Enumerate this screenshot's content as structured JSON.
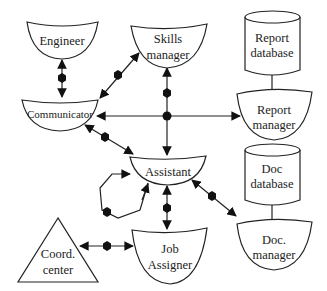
{
  "diagram": {
    "nodes": {
      "engineer": {
        "label": "Engineer",
        "shape": "bowl"
      },
      "skills_manager": {
        "label_line1": "Skills",
        "label_line2": "manager",
        "shape": "bowl"
      },
      "report_database": {
        "label_line1": "Report",
        "label_line2": "database",
        "shape": "cylinder"
      },
      "report_manager": {
        "label_line1": "Report",
        "label_line2": "manager",
        "shape": "bowl"
      },
      "communicator": {
        "label": "Communicator",
        "shape": "bowl"
      },
      "assistant": {
        "label": "Assistant",
        "shape": "bowl"
      },
      "doc_database": {
        "label_line1": "Doc",
        "label_line2": "database",
        "shape": "cylinder"
      },
      "doc_manager": {
        "label_line1": "Doc.",
        "label_line2": "manager",
        "shape": "bowl"
      },
      "coord_center": {
        "label_line1": "Coord.",
        "label_line2": "center",
        "shape": "triangle"
      },
      "job_assigner": {
        "label_line1": "Job",
        "label_line2": "Assigner",
        "shape": "bowl"
      }
    },
    "edges": [
      {
        "from": "Engineer",
        "to": "Communicator",
        "type": "bidirectional-with-hexagon"
      },
      {
        "from": "Skills manager",
        "to": "Communicator",
        "type": "bidirectional-with-hexagon"
      },
      {
        "from": "Skills manager",
        "to": "Junction",
        "type": "arrow-to-skills-with-hexagon"
      },
      {
        "from": "Junction",
        "to": "Communicator",
        "type": "arrow"
      },
      {
        "from": "Junction",
        "to": "Report manager",
        "type": "arrow"
      },
      {
        "from": "Junction",
        "to": "Assistant",
        "type": "arrow"
      },
      {
        "from": "Communicator",
        "to": "Assistant",
        "type": "bidirectional-with-hexagon"
      },
      {
        "from": "Assistant",
        "to": "Assistant",
        "type": "self-loop-with-hexagon"
      },
      {
        "from": "Assistant",
        "to": "Job Assigner",
        "type": "bidirectional-with-hexagon"
      },
      {
        "from": "Assistant",
        "to": "Doc. manager",
        "type": "bidirectional-with-hexagon"
      },
      {
        "from": "Coord. center",
        "to": "Job Assigner",
        "type": "bidirectional-with-hexagon"
      },
      {
        "from": "Report database",
        "to": "Report manager",
        "type": "line"
      },
      {
        "from": "Doc database",
        "to": "Doc. manager",
        "type": "line"
      }
    ],
    "colors": {
      "stroke": "#222222",
      "background": "#ffffff",
      "fill": "#ffffff"
    }
  }
}
